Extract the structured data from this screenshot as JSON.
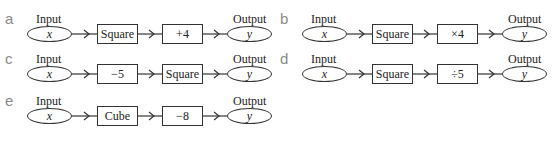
{
  "diagrams": [
    {
      "letter": "a",
      "input_label": "Input",
      "output_label": "Output",
      "input_var": "x",
      "step1": "Square",
      "step2": "+4",
      "output_var": "y"
    },
    {
      "letter": "b",
      "input_label": "Input",
      "output_label": "Output",
      "input_var": "x",
      "step1": "Square",
      "step2": "×4",
      "output_var": "y"
    },
    {
      "letter": "c",
      "input_label": "Input",
      "output_label": "Output",
      "input_var": "x",
      "step1": "−5",
      "step2": "Square",
      "output_var": "y"
    },
    {
      "letter": "d",
      "input_label": "Input",
      "output_label": "Output",
      "input_var": "x",
      "step1": "Square",
      "step2": "÷5",
      "output_var": "y"
    },
    {
      "letter": "e",
      "input_label": "Input",
      "output_label": "Output",
      "input_var": "x",
      "step1": "Cube",
      "step2": "−8",
      "output_var": "y"
    }
  ],
  "colors": {
    "letter": "#8a8a8a",
    "stroke": "#333333",
    "text": "#222222"
  }
}
